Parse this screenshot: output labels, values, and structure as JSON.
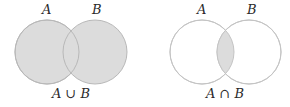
{
  "panels": [
    {
      "id": "union",
      "set_a_label": "A",
      "set_b_label": "B",
      "caption_left": "A",
      "caption_op": " ∪ ",
      "caption_right": "B",
      "shaded": "union"
    },
    {
      "id": "intersection",
      "set_a_label": "A",
      "set_b_label": "B",
      "caption_left": "A",
      "caption_op": " ∩ ",
      "caption_right": "B",
      "shaded": "intersection"
    }
  ],
  "colors": {
    "fill": "#dcdcdc",
    "stroke": "#b8b8b8",
    "background": "#ffffff"
  }
}
